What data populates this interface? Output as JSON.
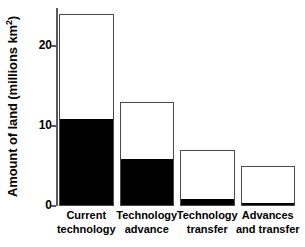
{
  "chart_data": {
    "type": "bar",
    "title": "",
    "subtitle": "",
    "xlabel": "",
    "ylabel": "Amount of land (millions km",
    "ylabel_sup": "2",
    "ylabel_suffix": ")",
    "ylabel_full": "Amount of land (millions km2)",
    "categories": [
      "Current technology",
      "Technology advance",
      "Technology transfer",
      "Advances and transfer"
    ],
    "category_lines": [
      [
        "Current",
        "technology"
      ],
      [
        "Technology",
        "advance"
      ],
      [
        "Technology",
        "transfer"
      ],
      [
        "Advances",
        "and transfer"
      ]
    ],
    "series": [
      {
        "name": "filled",
        "color": "#000000",
        "values": [
          11,
          6,
          1,
          0.5
        ]
      },
      {
        "name": "total",
        "color": "#ffffff",
        "values": [
          24,
          13,
          7,
          5
        ]
      }
    ],
    "values": [
      24,
      13,
      7,
      5
    ],
    "ylim": [
      0,
      24.75
    ],
    "yticks": [
      0,
      10,
      20
    ],
    "ytick_labels": [
      "0",
      "10",
      "20"
    ],
    "grid": false,
    "legend": "none",
    "stacked": true
  },
  "axis": {
    "tick_0": "0",
    "tick_10": "10",
    "tick_20": "20"
  },
  "colors": {
    "fill": "#000000",
    "outline": "#4a4a4a",
    "background": "#ffffff",
    "axis": "#5a5a5a"
  }
}
